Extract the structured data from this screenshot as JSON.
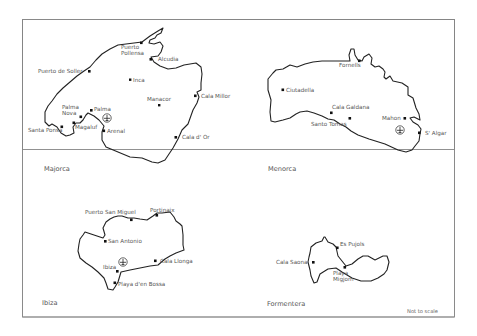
{
  "map": {
    "note": "Not to scale",
    "islands": [
      {
        "name": "Majorca",
        "places": [
          "Puerto Pollensa",
          "Alcudia",
          "Puerto de Soller",
          "Inca",
          "Cala Millor",
          "Manacor",
          "Palma Nova",
          "Palma",
          "Santa Ponsa",
          "Magaluf",
          "Arenal",
          "Cala d' Or"
        ]
      },
      {
        "name": "Menorca",
        "places": [
          "Fornells",
          "Ciutadella",
          "Cala Galdana",
          "Santo Tomas",
          "Mahon",
          "S' Algar"
        ]
      },
      {
        "name": "Ibiza",
        "places": [
          "Puerto San Miguel",
          "Portinaix",
          "San Antonio",
          "Ibiza",
          "Cala Llonga",
          "Playa d'en Bossa"
        ]
      },
      {
        "name": "Formentera",
        "places": [
          "Es Pujols",
          "Cala Saona",
          "Playa Migjorn"
        ]
      }
    ]
  },
  "labels": {
    "majorca": {
      "name": "Majorca",
      "puerto_pollensa_1": "Puerto",
      "puerto_pollensa_2": "Pollensa",
      "alcudia": "Alcudia",
      "puerto_de_soller": "Puerto de Soller",
      "inca": "Inca",
      "cala_millor": "Cala Millor",
      "manacor": "Manacor",
      "palma_nova_1": "Palma",
      "palma_nova_2": "Nova",
      "palma": "Palma",
      "santa_ponsa": "Santa Ponsa",
      "magaluf": "Magaluf",
      "arenal": "Arenal",
      "cala_dor": "Cala d' Or"
    },
    "menorca": {
      "name": "Menorca",
      "fornells": "Fornells",
      "ciutadella": "Ciutadella",
      "cala_galdana": "Cala Galdana",
      "santo_tomas": "Santo Tomas",
      "mahon": "Mahon",
      "s_algar": "S' Algar"
    },
    "ibiza": {
      "name": "Ibiza",
      "puerto_san_miguel": "Puerto San Miguel",
      "portinaix": "Portinaix",
      "san_antonio": "San Antonio",
      "ibiza_town": "Ibiza",
      "cala_llonga": "Cala Llonga",
      "playa_den_bossa": "Playa d'en Bossa"
    },
    "formentera": {
      "name": "Formentera",
      "es_pujols": "Es Pujols",
      "cala_saona": "Cala Saona",
      "playa_migjorn_1": "Playa",
      "playa_migjorn_2": "Migjorn"
    }
  },
  "icons": {
    "airport": "airport-icon"
  },
  "colors": {
    "coastline": "#222222",
    "frame": "#555555",
    "text": "#555555",
    "background": "#ffffff"
  }
}
